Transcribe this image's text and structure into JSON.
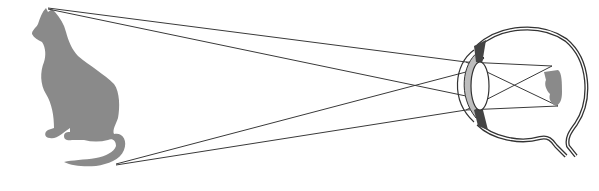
{
  "diagram": {
    "object": {
      "label": "cat",
      "color": "#8a8a8a"
    },
    "eye": {
      "label": "eye",
      "retina_image_label": "inverted cat image",
      "lens_fill": "#ffffff",
      "cornea_fill": "#bdbdbd",
      "outline": "#333333"
    },
    "rays": {
      "color": "#3a3a3a",
      "count": 4
    }
  }
}
